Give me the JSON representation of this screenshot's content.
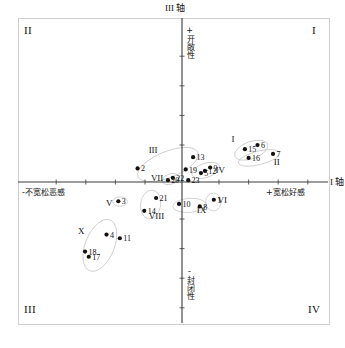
{
  "figure": {
    "axes": {
      "horizontal": {
        "name": "I 轴",
        "negative_label": "-不宽松恶感",
        "positive_label": "+宽松好感"
      },
      "vertical": {
        "name": "III 轴",
        "positive_label": "+开敞性",
        "negative_label": "-封闭性"
      }
    },
    "quadrants": {
      "top_right": "I",
      "top_left": "II",
      "bottom_left": "III",
      "bottom_right": "IV"
    },
    "colors": {
      "axis": "#3a3a3a",
      "point": "#111111",
      "ellipse": "#c9c9c9",
      "frame": "#cfcfcf",
      "text": "#111111"
    }
  },
  "chart_data": {
    "type": "scatter",
    "title": "",
    "xlabel": "I 轴",
    "ylabel": "III 轴",
    "xlim": [
      -1,
      1
    ],
    "ylim": [
      -1,
      1
    ],
    "grid": false,
    "legend": "none",
    "axis_annotations": [
      {
        "name": "x-negative",
        "text": "-不宽松恶感"
      },
      {
        "name": "x-positive",
        "text": "+宽松好感"
      },
      {
        "name": "y-positive",
        "text": "+开敞性"
      },
      {
        "name": "y-negative",
        "text": "-封闭性"
      }
    ],
    "points": [
      {
        "label": "1",
        "x": 0.215,
        "y": -0.12
      },
      {
        "label": "2",
        "x": -0.3,
        "y": 0.092
      },
      {
        "label": "3",
        "x": -0.43,
        "y": -0.13
      },
      {
        "label": "4",
        "x": -0.51,
        "y": -0.355
      },
      {
        "label": "5",
        "x": 0.128,
        "y": 0.06
      },
      {
        "label": "6",
        "x": 0.51,
        "y": 0.25
      },
      {
        "label": "7",
        "x": 0.615,
        "y": 0.19
      },
      {
        "label": "8",
        "x": 0.12,
        "y": -0.165
      },
      {
        "label": "9",
        "x": 0.19,
        "y": 0.098
      },
      {
        "label": "10",
        "x": -0.02,
        "y": -0.148
      },
      {
        "label": "11",
        "x": -0.42,
        "y": -0.38
      },
      {
        "label": "12",
        "x": 0.155,
        "y": 0.075
      },
      {
        "label": "13",
        "x": 0.075,
        "y": 0.168
      },
      {
        "label": "14",
        "x": -0.255,
        "y": -0.195
      },
      {
        "label": "15",
        "x": 0.425,
        "y": 0.222
      },
      {
        "label": "16",
        "x": 0.45,
        "y": 0.163
      },
      {
        "label": "17",
        "x": -0.63,
        "y": -0.505
      },
      {
        "label": "18",
        "x": -0.655,
        "y": -0.47
      },
      {
        "label": "19",
        "x": 0.025,
        "y": 0.085
      },
      {
        "label": "20",
        "x": -0.095,
        "y": 0.012
      },
      {
        "label": "21",
        "x": -0.175,
        "y": -0.108
      },
      {
        "label": "22",
        "x": -0.062,
        "y": 0.028
      },
      {
        "label": "23",
        "x": 0.042,
        "y": 0.012
      }
    ],
    "clusters": [
      {
        "label": "I",
        "members": [
          "15",
          "6",
          "16"
        ],
        "cx": 0.468,
        "cy": 0.215,
        "rx": 0.118,
        "ry": 0.058,
        "rot": -20,
        "lx": 0.345,
        "ly": 0.272
      },
      {
        "label": "II",
        "members": [
          "7",
          "16"
        ],
        "cx": 0.52,
        "cy": 0.163,
        "rx": 0.142,
        "ry": 0.046,
        "rot": -14,
        "lx": 0.64,
        "ly": 0.118
      },
      {
        "label": "III",
        "members": [
          "13",
          "2",
          "19"
        ],
        "cx": -0.095,
        "cy": 0.118,
        "rx": 0.218,
        "ry": 0.088,
        "rot": -22,
        "lx": -0.195,
        "ly": 0.195
      },
      {
        "label": "IV",
        "members": [
          "9",
          "12",
          "5"
        ],
        "cx": 0.16,
        "cy": 0.078,
        "rx": 0.098,
        "ry": 0.048,
        "rot": -18,
        "lx": 0.258,
        "ly": 0.062
      },
      {
        "label": "V",
        "members": [
          "3"
        ],
        "cx": -0.418,
        "cy": -0.132,
        "rx": 0.05,
        "ry": 0.032,
        "rot": 0,
        "lx": -0.492,
        "ly": -0.162
      },
      {
        "label": "VI",
        "members": [
          "1"
        ],
        "cx": 0.212,
        "cy": -0.135,
        "rx": 0.052,
        "ry": 0.06,
        "rot": 0,
        "lx": 0.272,
        "ly": -0.142
      },
      {
        "label": "VII",
        "members": [
          "22",
          "20"
        ],
        "cx": -0.078,
        "cy": 0.02,
        "rx": 0.058,
        "ry": 0.035,
        "rot": -18,
        "lx": -0.168,
        "ly": 0.01
      },
      {
        "label": "VIII",
        "members": [
          "21",
          "14"
        ],
        "cx": -0.212,
        "cy": -0.152,
        "rx": 0.068,
        "ry": 0.098,
        "rot": 8,
        "lx": -0.172,
        "ly": -0.248
      },
      {
        "label": "IX",
        "members": [
          "10",
          "8"
        ],
        "cx": 0.05,
        "cy": -0.158,
        "rx": 0.112,
        "ry": 0.048,
        "rot": -4,
        "lx": 0.132,
        "ly": -0.212
      },
      {
        "label": "X",
        "members": [
          "4",
          "11",
          "18",
          "17"
        ],
        "cx": -0.555,
        "cy": -0.428,
        "rx": 0.098,
        "ry": 0.185,
        "rot": 22,
        "lx": -0.68,
        "ly": -0.348
      }
    ]
  }
}
